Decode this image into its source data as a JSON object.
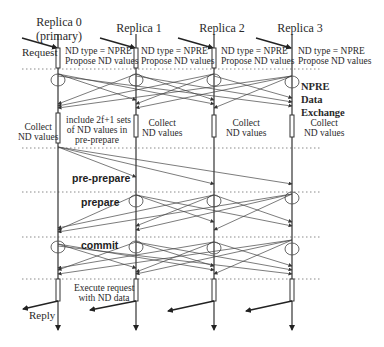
{
  "replicas": [
    {
      "name": "Replica 0",
      "subtitle": "(primary)",
      "x": 58
    },
    {
      "name": "Replica 1",
      "subtitle": "",
      "x": 136
    },
    {
      "name": "Replica 2",
      "subtitle": "",
      "x": 214
    },
    {
      "name": "Replica 3",
      "subtitle": "",
      "x": 292
    }
  ],
  "labels": {
    "request": "Request",
    "reply": "Reply",
    "nd_type": "ND type = NPRE",
    "propose": "Propose ND values",
    "npre_title_1": "NPRE",
    "npre_title_2": "Data",
    "npre_title_3": "Exchange",
    "collect_1": "Collect",
    "collect_2": "ND values",
    "include_1": "include 2f+1 sets",
    "include_2": "of ND values in",
    "include_3": "pre-prepare",
    "pre_prepare": "pre-prepare",
    "prepare": "prepare",
    "commit": "commit",
    "execute_1": "Execute request",
    "execute_2": "with ND data"
  },
  "phases": [
    "NPRE Data Exchange",
    "pre-prepare",
    "prepare",
    "commit",
    "Execute"
  ],
  "colors": {
    "line": "#333333",
    "dotted": "#888888",
    "text": "#2a2a2a"
  }
}
